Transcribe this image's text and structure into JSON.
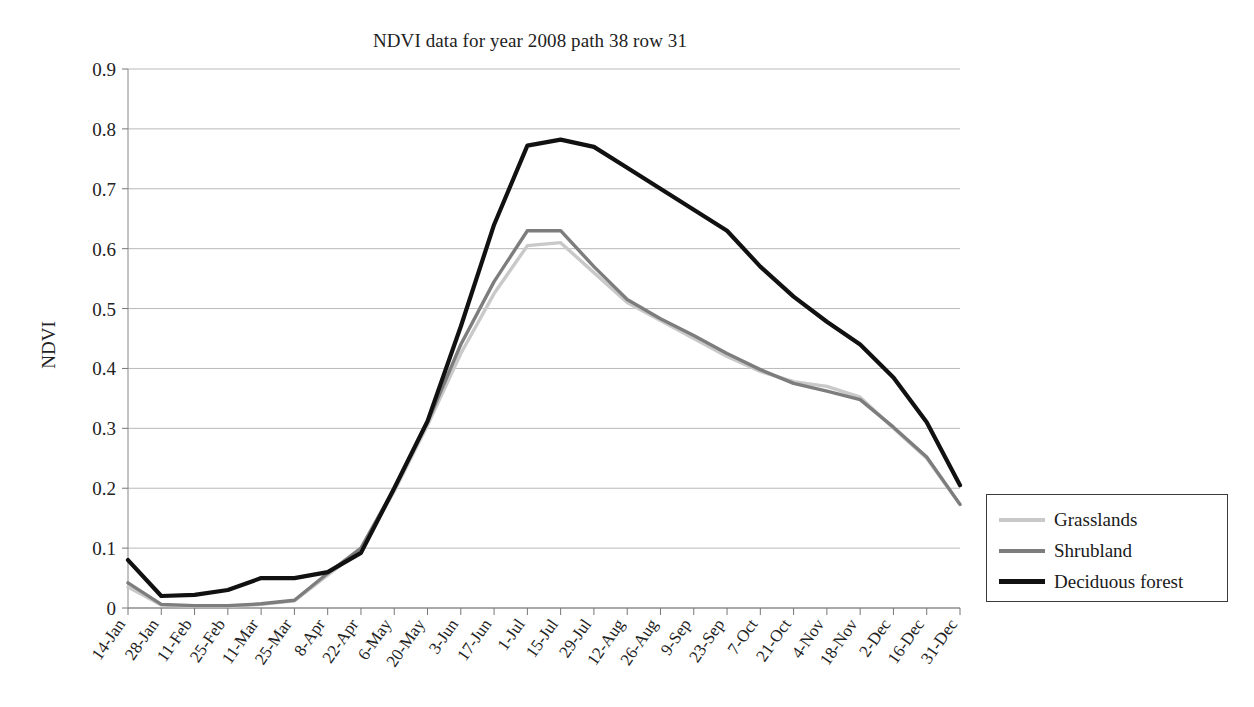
{
  "figure": {
    "title": "NDVI data for year 2008 path 38 row 31",
    "y_axis_title": "NDVI"
  },
  "legend": {
    "entries": [
      {
        "label": "Grasslands",
        "color": "#c9c9c9"
      },
      {
        "label": "Shrubland",
        "color": "#7d7d7d"
      },
      {
        "label": "Deciduous forest",
        "color": "#111111"
      }
    ]
  },
  "axes": {
    "y_ticks": [
      "0",
      "0.1",
      "0.2",
      "0.3",
      "0.4",
      "0.5",
      "0.6",
      "0.7",
      "0.8",
      "0.9"
    ],
    "x_ticks": [
      "14-Jan",
      "28-Jan",
      "11-Feb",
      "25-Feb",
      "11-Mar",
      "25-Mar",
      "8-Apr",
      "22-Apr",
      "6-May",
      "20-May",
      "3-Jun",
      "17-Jun",
      "1-Jul",
      "15-Jul",
      "29-Jul",
      "12-Aug",
      "26-Aug",
      "9-Sep",
      "23-Sep",
      "7-Oct",
      "21-Oct",
      "4-Nov",
      "18-Nov",
      "2-Dec",
      "16-Dec",
      "31-Dec"
    ]
  },
  "chart_data": {
    "type": "line",
    "title": "NDVI data for year 2008 path 38 row 31",
    "xlabel": "",
    "ylabel": "NDVI",
    "ylim": [
      0,
      0.9
    ],
    "ytick_step": 0.1,
    "grid": "horizontal",
    "legend_position": "right-outside",
    "categories": [
      "14-Jan",
      "28-Jan",
      "11-Feb",
      "25-Feb",
      "11-Mar",
      "25-Mar",
      "8-Apr",
      "22-Apr",
      "6-May",
      "20-May",
      "3-Jun",
      "17-Jun",
      "1-Jul",
      "15-Jul",
      "29-Jul",
      "12-Aug",
      "26-Aug",
      "9-Sep",
      "23-Sep",
      "7-Oct",
      "21-Oct",
      "4-Nov",
      "18-Nov",
      "2-Dec",
      "16-Dec",
      "31-Dec"
    ],
    "series": [
      {
        "name": "Grasslands",
        "color": "#c9c9c9",
        "values": [
          0.035,
          0.005,
          0.003,
          0.003,
          0.006,
          0.012,
          0.055,
          0.098,
          0.195,
          0.305,
          0.425,
          0.525,
          0.605,
          0.61,
          0.56,
          0.51,
          0.48,
          0.45,
          0.42,
          0.395,
          0.378,
          0.37,
          0.352,
          0.3,
          0.25,
          0.173
        ]
      },
      {
        "name": "Shrubland",
        "color": "#7d7d7d",
        "values": [
          0.042,
          0.006,
          0.004,
          0.004,
          0.007,
          0.013,
          0.058,
          0.1,
          0.2,
          0.31,
          0.44,
          0.545,
          0.63,
          0.63,
          0.57,
          0.515,
          0.483,
          0.455,
          0.425,
          0.398,
          0.375,
          0.362,
          0.348,
          0.302,
          0.252,
          0.173
        ]
      },
      {
        "name": "Deciduous forest",
        "color": "#111111",
        "values": [
          0.08,
          0.02,
          0.022,
          0.03,
          0.05,
          0.05,
          0.06,
          0.092,
          0.2,
          0.312,
          0.47,
          0.64,
          0.772,
          0.782,
          0.77,
          0.735,
          0.7,
          0.665,
          0.63,
          0.57,
          0.52,
          0.478,
          0.44,
          0.385,
          0.31,
          0.205
        ]
      }
    ]
  }
}
